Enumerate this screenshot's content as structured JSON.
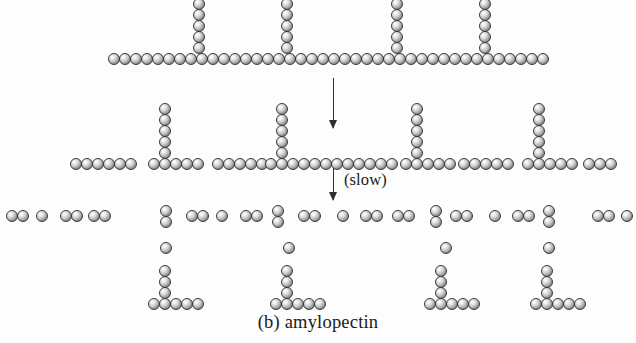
{
  "figure": {
    "caption": "(b) amylopectin",
    "subject": "amylopectin",
    "panel_letter": "(b)",
    "bead_semantic": "glucose-unit-sphere",
    "bead_diameter_px": 12,
    "bead_spacing_px": 11,
    "colors": {
      "background": "#fdfdfd",
      "bead_outline": "#3a3a3a",
      "bead_highlight": "#ffffff",
      "bead_shadow": "#6e6e6e",
      "arrow": "#2e2e2e",
      "text": "#1a1a1a"
    }
  },
  "annotations": [
    {
      "name": "hydrolysis-arrow-1",
      "label": "",
      "x": 333,
      "y": 78,
      "length": 50
    },
    {
      "name": "hydrolysis-arrow-2",
      "label": "(slow)",
      "x": 333,
      "y": 168,
      "length": 32,
      "label_x": 344,
      "label_y": 170
    }
  ],
  "stages": [
    {
      "name": "stage-1-intact-amylopectin",
      "description": "Intact branched amylopectin polymer: one long backbone chain with four side branches",
      "backbone": {
        "name": "backbone-chain",
        "y": 53,
        "x_start": 108,
        "count": 40
      },
      "branches": [
        {
          "name": "branch-1",
          "x": 193,
          "y_bottom": 42,
          "count": 6
        },
        {
          "name": "branch-2",
          "x": 281,
          "y_bottom": 42,
          "count": 6
        },
        {
          "name": "branch-3",
          "x": 391,
          "y_bottom": 42,
          "count": 6
        },
        {
          "name": "branch-4",
          "x": 479,
          "y_bottom": 42,
          "count": 5
        }
      ]
    },
    {
      "name": "stage-2-partial-hydrolysis",
      "description": "Partially hydrolyzed fragments: linear oligosaccharides alternating with branched limit dextrins",
      "fragments": [
        {
          "name": "fragment-linear-a",
          "type": "linear",
          "x": 70,
          "y": 158,
          "count": 6
        },
        {
          "name": "fragment-branched-a",
          "type": "branched",
          "x": 148,
          "y": 158,
          "count": 5,
          "branch_x_offset": 11,
          "branch_count": 5
        },
        {
          "name": "fragment-linear-b",
          "type": "linear",
          "x": 212,
          "y": 158,
          "count": 5
        },
        {
          "name": "fragment-branched-b",
          "type": "branched",
          "x": 265,
          "y": 158,
          "count": 5,
          "branch_x_offset": 11,
          "branch_count": 5
        },
        {
          "name": "fragment-linear-c",
          "type": "linear",
          "x": 320,
          "y": 158,
          "count": 7
        },
        {
          "name": "fragment-branched-c",
          "type": "branched",
          "x": 400,
          "y": 158,
          "count": 5,
          "branch_x_offset": 11,
          "branch_count": 5
        },
        {
          "name": "fragment-linear-d",
          "type": "linear",
          "x": 458,
          "y": 158,
          "count": 5
        },
        {
          "name": "fragment-branched-d",
          "type": "branched",
          "x": 522,
          "y": 158,
          "count": 5,
          "branch_x_offset": 11,
          "branch_count": 5
        },
        {
          "name": "fragment-linear-e",
          "type": "linear",
          "x": 583,
          "y": 158,
          "count": 3
        }
      ]
    },
    {
      "name": "stage-3-small-fragments",
      "description": "Small products of slow hydrolysis: maltose pairs, free glucose units, and residual branched limit dextrins",
      "small_units": [
        {
          "name": "maltose-pair",
          "type": "pair",
          "x": 6,
          "y": 210
        },
        {
          "name": "glucose-single",
          "type": "single",
          "x": 36,
          "y": 210
        },
        {
          "name": "maltose-pair",
          "type": "pair",
          "x": 60,
          "y": 210
        },
        {
          "name": "maltose-pair",
          "type": "pair",
          "x": 88,
          "y": 210
        },
        {
          "name": "maltose-pair",
          "type": "pair",
          "x": 186,
          "y": 210
        },
        {
          "name": "glucose-single",
          "type": "single",
          "x": 216,
          "y": 210
        },
        {
          "name": "maltose-pair",
          "type": "pair",
          "x": 240,
          "y": 210
        },
        {
          "name": "maltose-pair",
          "type": "pair",
          "x": 298,
          "y": 210
        },
        {
          "name": "glucose-single",
          "type": "single",
          "x": 337,
          "y": 210
        },
        {
          "name": "maltose-pair",
          "type": "pair",
          "x": 360,
          "y": 210
        },
        {
          "name": "maltose-pair",
          "type": "pair",
          "x": 392,
          "y": 210
        },
        {
          "name": "maltose-pair",
          "type": "pair",
          "x": 450,
          "y": 210
        },
        {
          "name": "glucose-single",
          "type": "single",
          "x": 489,
          "y": 210
        },
        {
          "name": "maltose-pair",
          "type": "pair",
          "x": 512,
          "y": 210
        },
        {
          "name": "maltose-pair",
          "type": "pair",
          "x": 592,
          "y": 210
        },
        {
          "name": "glucose-single",
          "type": "single",
          "x": 621,
          "y": 210
        }
      ],
      "vertical_pairs": [
        {
          "name": "vertical-maltose-pair",
          "x": 160,
          "y": 205
        },
        {
          "name": "vertical-maltose-pair",
          "x": 272,
          "y": 205
        },
        {
          "name": "vertical-maltose-pair",
          "x": 430,
          "y": 205
        },
        {
          "name": "vertical-maltose-pair",
          "x": 543,
          "y": 205
        }
      ],
      "lone_glucose": [
        {
          "name": "glucose-single",
          "x": 160,
          "y": 242
        },
        {
          "name": "glucose-single",
          "x": 283,
          "y": 242
        },
        {
          "name": "glucose-single",
          "x": 440,
          "y": 242
        },
        {
          "name": "glucose-single",
          "x": 543,
          "y": 242
        }
      ],
      "limit_dextrins": [
        {
          "name": "limit-dextrin",
          "x": 148,
          "y": 298,
          "base_count": 5,
          "stem_x_offset": 11,
          "stem_count": 3
        },
        {
          "name": "limit-dextrin",
          "x": 270,
          "y": 298,
          "base_count": 5,
          "stem_x_offset": 11,
          "stem_count": 3
        },
        {
          "name": "limit-dextrin",
          "x": 424,
          "y": 298,
          "base_count": 5,
          "stem_x_offset": 11,
          "stem_count": 3
        },
        {
          "name": "limit-dextrin",
          "x": 530,
          "y": 298,
          "base_count": 5,
          "stem_x_offset": 11,
          "stem_count": 3
        }
      ]
    }
  ]
}
